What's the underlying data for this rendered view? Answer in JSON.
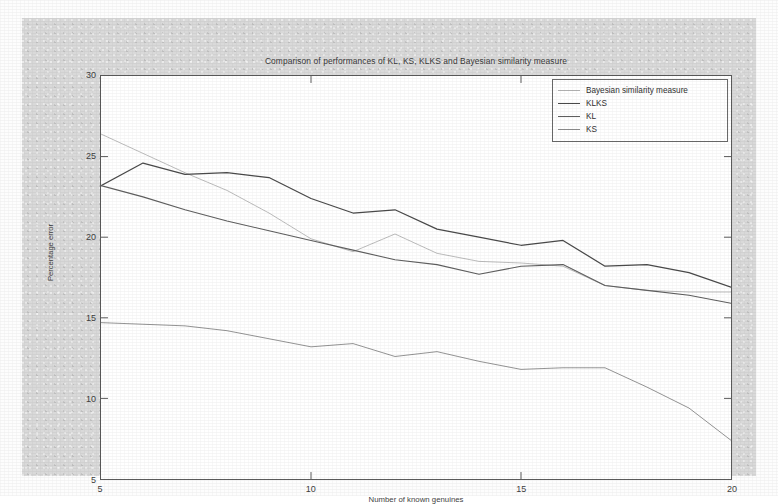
{
  "figure": {
    "background_color": "#d9d9d9",
    "plot_background_color": "#ffffff",
    "axis_color": "#5b5b5b"
  },
  "chart_data": {
    "type": "line",
    "title": "Comparison of performances of KL, KS, KLKS and Bayesian similarity measure",
    "xlabel": "Number of known genuines",
    "ylabel": "Percentage error",
    "xlim": [
      5,
      20
    ],
    "ylim": [
      5,
      30
    ],
    "xticks": [
      5,
      10,
      15,
      20
    ],
    "yticks": [
      5,
      10,
      15,
      20,
      25,
      30
    ],
    "xtick_labels": [
      "5",
      "10",
      "15",
      "20"
    ],
    "ytick_labels": [
      "5",
      "10",
      "15",
      "20",
      "25",
      "30"
    ],
    "grid": false,
    "legend_position": "top-right",
    "x": [
      5,
      6,
      7,
      8,
      9,
      10,
      11,
      12,
      13,
      14,
      15,
      16,
      17,
      18,
      19,
      20
    ],
    "series": [
      {
        "name": "Bayesian similarity measure",
        "color": "#b4b4b4",
        "width": 0.9,
        "values": [
          26.4,
          25.2,
          24.0,
          22.9,
          21.5,
          19.9,
          19.1,
          20.2,
          19.0,
          18.5,
          18.4,
          18.2,
          17.0,
          16.7,
          16.6,
          16.6
        ]
      },
      {
        "name": "KLKS",
        "color": "#4a4a4a",
        "width": 1.25,
        "values": [
          23.2,
          24.6,
          23.9,
          24.0,
          23.7,
          22.4,
          21.5,
          21.7,
          20.5,
          20.0,
          19.5,
          19.8,
          18.2,
          18.3,
          17.8,
          16.9
        ]
      },
      {
        "name": "KL",
        "color": "#5f5f5f",
        "width": 1.1,
        "values": [
          23.2,
          22.5,
          21.7,
          21.0,
          20.4,
          19.8,
          19.2,
          18.6,
          18.3,
          17.7,
          18.2,
          18.3,
          17.0,
          16.7,
          16.4,
          15.9
        ]
      },
      {
        "name": "KS",
        "color": "#8e8e8e",
        "width": 0.95,
        "values": [
          14.7,
          14.6,
          14.5,
          14.2,
          13.7,
          13.2,
          13.4,
          12.6,
          12.9,
          12.3,
          11.8,
          11.9,
          11.9,
          10.7,
          9.4,
          7.4
        ]
      }
    ]
  }
}
